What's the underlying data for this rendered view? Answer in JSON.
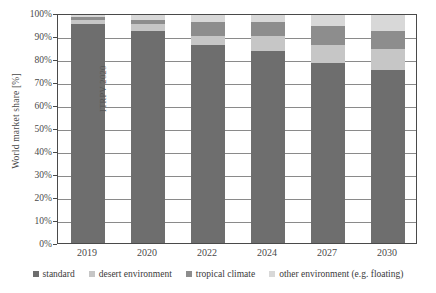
{
  "chart_data": {
    "type": "bar",
    "stacked": true,
    "title": "",
    "xlabel": "",
    "ylabel": "World market share [%]",
    "categories": [
      "2019",
      "2020",
      "2022",
      "2024",
      "2027",
      "2030"
    ],
    "ylim": [
      0,
      100
    ],
    "ytick_labels": [
      "0%",
      "10%",
      "20%",
      "30%",
      "40%",
      "50%",
      "60%",
      "70%",
      "80%",
      "90%",
      "100%"
    ],
    "ytick_values": [
      0,
      10,
      20,
      30,
      40,
      50,
      60,
      70,
      80,
      90,
      100
    ],
    "grid": "horizontal",
    "legend_position": "bottom",
    "series": [
      {
        "name": "standard",
        "color": "#6e6e6e",
        "values": [
          96,
          93,
          87,
          84,
          79,
          76
        ]
      },
      {
        "name": "desert environment",
        "color": "#c6c6c6",
        "values": [
          2,
          3,
          4,
          7,
          8,
          9
        ]
      },
      {
        "name": "tropical climate",
        "color": "#8d8d8d",
        "values": [
          1,
          2,
          6,
          6,
          8,
          8
        ]
      },
      {
        "name": "other environment (e.g. floating)",
        "color": "#d8d8d8",
        "values": [
          1,
          2,
          3,
          3,
          5,
          7
        ]
      }
    ],
    "annotations": [
      {
        "text": "ITRPV 2020",
        "rotation": -90
      }
    ]
  },
  "legend": {
    "items": [
      {
        "label": "standard"
      },
      {
        "label": "desert environment"
      },
      {
        "label": "tropical climate"
      },
      {
        "label": "other environment (e.g. floating)"
      }
    ]
  }
}
